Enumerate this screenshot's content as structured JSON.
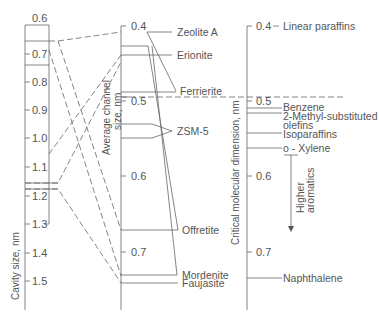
{
  "left_axis": {
    "title": "Cavity size, nm",
    "ticks": [
      "0.6",
      "0.7",
      "0.8",
      "0.9",
      "1.0",
      "1.1",
      "1.2",
      "1.3",
      "1.4",
      "1.5"
    ]
  },
  "middle_axis": {
    "title_line1": "Average channel",
    "title_line2": "size, nm",
    "ticks": [
      "0.4",
      "0.5",
      "0.6",
      "0.7"
    ],
    "zeolites": [
      "Zeolite A",
      "Erionite",
      "Ferrierite",
      "ZSM-5",
      "Offretite",
      "Mordenite",
      "Faujasite"
    ]
  },
  "right_axis": {
    "title": "Critical molecular dimension, nm",
    "ticks": [
      "0.4",
      "0.5",
      "0.6",
      "0.7"
    ],
    "molecules": {
      "linear_paraffins": "Linear paraffins",
      "benzene": "Benzene",
      "methyl_olefins_line1": "2-Methyl-substituted",
      "methyl_olefins_line2": "olefins",
      "isoparaffins": "Isoparaffins",
      "o_xylene": "o - Xylene",
      "naphthalene": "Naphthalene"
    },
    "arrow_label_line1": "Higher",
    "arrow_label_line2": "aromatics"
  }
}
